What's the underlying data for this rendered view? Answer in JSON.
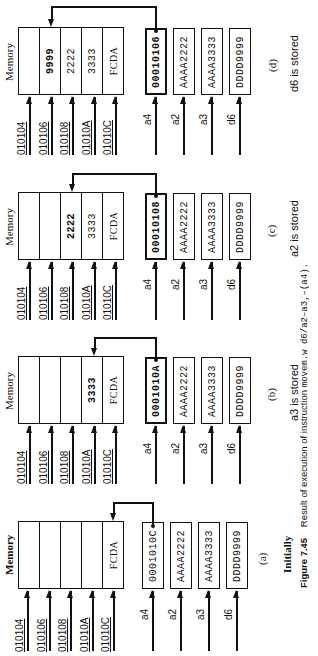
{
  "figure": {
    "number": "Figure 7.45",
    "caption_text": "Result of execution of instruction",
    "instruction": "movem.w d6/a2–a3,–(a4)."
  },
  "memory_title": "Memory",
  "address_labels": [
    "010104",
    "010106",
    "010108",
    "01010A",
    "01010C"
  ],
  "register_labels": [
    "a4",
    "a2",
    "a3",
    "d6"
  ],
  "panels": [
    {
      "id": "d",
      "label": "(d)",
      "caption": "d6  is stored",
      "memory": [
        "",
        "9999",
        "2222",
        "3333",
        "FCDA"
      ],
      "bold_cell": 1,
      "registers": [
        "00010106",
        "AAAA2222",
        "AAAA3333",
        "DDDD9999"
      ],
      "pointer_target_cell": 1
    },
    {
      "id": "c",
      "label": "(c)",
      "caption": "a2  is stored",
      "memory": [
        "",
        "",
        "2222",
        "3333",
        "FCDA"
      ],
      "bold_cell": 2,
      "registers": [
        "00010108",
        "AAAA2222",
        "AAAA3333",
        "DDDD9999"
      ],
      "pointer_target_cell": 2
    },
    {
      "id": "b",
      "label": "(b)",
      "caption": "a3  is stored",
      "memory": [
        "",
        "",
        "",
        "3333",
        "FCDA"
      ],
      "bold_cell": 3,
      "registers": [
        "0001010A",
        "AAAA2222",
        "AAAA3333",
        "DDDD9999"
      ],
      "pointer_target_cell": 3
    },
    {
      "id": "a",
      "label": "(a)",
      "caption": "Initially",
      "memory": [
        "",
        "",
        "",
        "",
        "FCDA"
      ],
      "bold_cell": -1,
      "registers": [
        "0001010C",
        "AAAA2222",
        "AAAA3333",
        "DDDD9999"
      ],
      "pointer_target_cell": 4
    }
  ]
}
